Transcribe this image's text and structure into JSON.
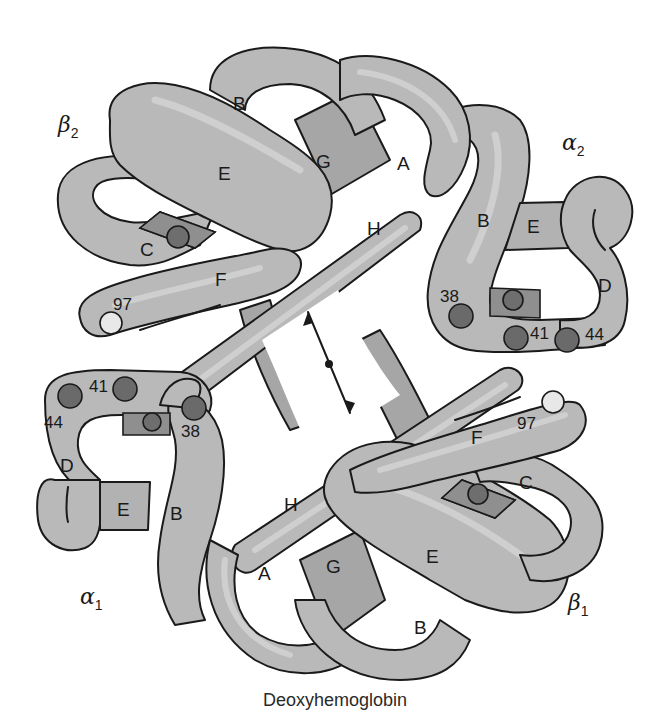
{
  "figure": {
    "caption": "Deoxyhemoglobin",
    "colors": {
      "tube": "#b9b9b9",
      "tube_dark": "#a6a6a6",
      "outline": "#1a1a1a",
      "residue_dark": "#6a6a6a",
      "residue_light": "#e8e8e8",
      "background": "#ffffff"
    },
    "subunits": [
      {
        "id": "beta2",
        "symbol": "β",
        "subscript": "2"
      },
      {
        "id": "alpha2",
        "symbol": "α",
        "subscript": "2"
      },
      {
        "id": "alpha1",
        "symbol": "α",
        "subscript": "1"
      },
      {
        "id": "beta1",
        "symbol": "β",
        "subscript": "1"
      }
    ],
    "helices": {
      "beta2": {
        "B": "B",
        "E": "E",
        "C": "C",
        "F": "F",
        "G": "G"
      },
      "alpha2": {
        "A": "A",
        "H": "H",
        "B": "B",
        "E": "E",
        "D": "D"
      },
      "alpha1": {
        "D": "D",
        "E": "E",
        "B": "B",
        "H": "H",
        "A": "A"
      },
      "beta1": {
        "G": "G",
        "E": "E",
        "B": "B",
        "F": "F",
        "C": "C"
      }
    },
    "residues": {
      "beta2_97": "97",
      "alpha2_38": "38",
      "alpha2_41": "41",
      "alpha2_44": "44",
      "alpha1_41": "41",
      "alpha1_44": "44",
      "alpha1_38": "38",
      "beta1_97": "97"
    },
    "annotations": {
      "central_cavity_arrow": "double-headed arrow across central cavity"
    }
  }
}
